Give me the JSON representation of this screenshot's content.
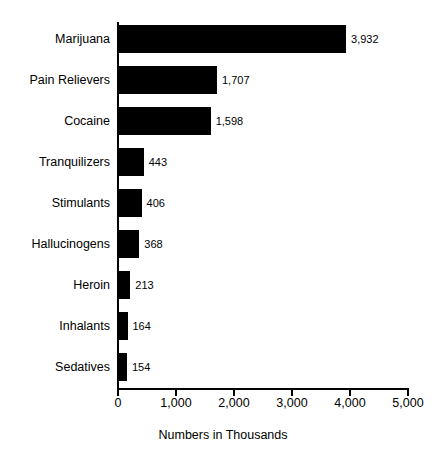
{
  "chart_data": {
    "type": "bar",
    "orientation": "horizontal",
    "title": "",
    "subtitle": "",
    "xlabel": "Numbers in Thousands",
    "ylabel": "",
    "categories": [
      "Marijuana",
      "Pain Relievers",
      "Cocaine",
      "Tranquilizers",
      "Stimulants",
      "Hallucinogens",
      "Heroin",
      "Inhalants",
      "Sedatives"
    ],
    "values": [
      3932,
      1707,
      1598,
      443,
      406,
      368,
      213,
      164,
      154
    ],
    "value_labels": [
      "3,932",
      "1,707",
      "1,598",
      "443",
      "406",
      "368",
      "213",
      "164",
      "154"
    ],
    "xlim": [
      0,
      5000
    ],
    "xticks": [
      0,
      1000,
      2000,
      3000,
      4000,
      5000
    ],
    "xtick_labels": [
      "0",
      "1,000",
      "2,000",
      "3,000",
      "4,000",
      "5,000"
    ],
    "grid": false,
    "legend": false,
    "legend_position": "none",
    "bar_color": "#000000",
    "background_color": "#ffffff",
    "axis_color": "#000000"
  }
}
